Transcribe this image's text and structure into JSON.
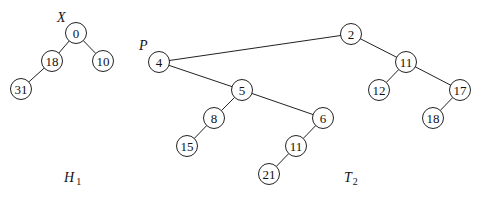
{
  "trees": [
    {
      "id": "H1",
      "caption": {
        "main": "H",
        "sub": "1"
      },
      "pointer_label": "X",
      "pointer_node": "h0",
      "nodes": [
        {
          "id": "h0",
          "value": "0"
        },
        {
          "id": "h18",
          "value": "18"
        },
        {
          "id": "h10",
          "value": "10"
        },
        {
          "id": "h31",
          "value": "31"
        }
      ],
      "edges": [
        [
          "h0",
          "h18"
        ],
        [
          "h0",
          "h10"
        ],
        [
          "h18",
          "h31"
        ]
      ]
    },
    {
      "id": "T2",
      "caption": {
        "main": "T",
        "sub": "2"
      },
      "pointer_label": "P",
      "pointer_node": "t4",
      "nodes": [
        {
          "id": "t2",
          "value": "2"
        },
        {
          "id": "t4",
          "value": "4"
        },
        {
          "id": "t11a",
          "value": "11"
        },
        {
          "id": "t12",
          "value": "12"
        },
        {
          "id": "t17",
          "value": "17"
        },
        {
          "id": "t18",
          "value": "18"
        },
        {
          "id": "t5",
          "value": "5"
        },
        {
          "id": "t8",
          "value": "8"
        },
        {
          "id": "t15",
          "value": "15"
        },
        {
          "id": "t6",
          "value": "6"
        },
        {
          "id": "t11b",
          "value": "11"
        },
        {
          "id": "t21",
          "value": "21"
        }
      ],
      "edges": [
        [
          "t2",
          "t4"
        ],
        [
          "t2",
          "t11a"
        ],
        [
          "t11a",
          "t12"
        ],
        [
          "t11a",
          "t17"
        ],
        [
          "t17",
          "t18"
        ],
        [
          "t4",
          "t5"
        ],
        [
          "t5",
          "t8"
        ],
        [
          "t8",
          "t15"
        ],
        [
          "t5",
          "t6"
        ],
        [
          "t6",
          "t11b"
        ],
        [
          "t11b",
          "t21"
        ]
      ]
    }
  ]
}
